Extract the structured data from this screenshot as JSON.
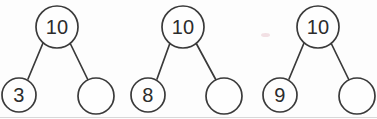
{
  "worksheet": {
    "title": "Number bonds to 10",
    "background_color": "#fdfdfd",
    "ink_color": "#3a3a3a",
    "text_color": "#2c2c2c",
    "smudge_color": "#e9c9cf",
    "empty_label": ""
  },
  "diagrams": [
    {
      "id": "number-bond-1",
      "root": {
        "label": "10",
        "cx": 57,
        "cy": 27,
        "r": 21
      },
      "left": {
        "label": "3",
        "cx": 19,
        "cy": 95,
        "r": 17
      },
      "right": {
        "label": "",
        "cx": 96,
        "cy": 96,
        "r": 18
      }
    },
    {
      "id": "number-bond-2",
      "root": {
        "label": "10",
        "cx": 183,
        "cy": 27,
        "r": 21
      },
      "left": {
        "label": "8",
        "cx": 148,
        "cy": 95,
        "r": 17
      },
      "right": {
        "label": "",
        "cx": 224,
        "cy": 96,
        "r": 18
      }
    },
    {
      "id": "number-bond-3",
      "root": {
        "label": "10",
        "cx": 318,
        "cy": 27,
        "r": 21
      },
      "left": {
        "label": "9",
        "cx": 280,
        "cy": 95,
        "r": 17
      },
      "right": {
        "label": "",
        "cx": 357,
        "cy": 96,
        "r": 18
      }
    }
  ],
  "marks": [
    {
      "id": "pink-smudge",
      "x": 261,
      "y": 33,
      "width": 9,
      "height": 4
    }
  ]
}
